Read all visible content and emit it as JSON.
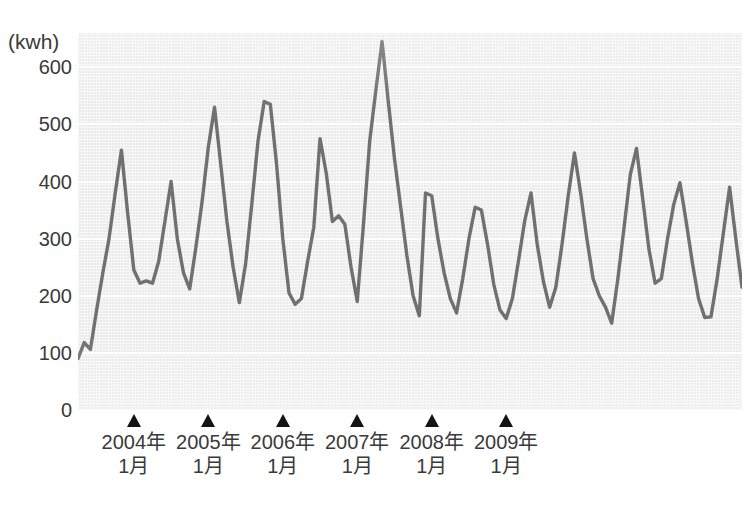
{
  "chart_data": {
    "type": "line",
    "title": "",
    "subtitle": "",
    "xlabel": "",
    "ylabel": "",
    "unit_label": "(kwh)",
    "grid": true,
    "legend": false,
    "ylim": [
      0,
      660
    ],
    "yticks": [
      0,
      100,
      200,
      300,
      400,
      500,
      600
    ],
    "ytick_labels": [
      "0",
      "100",
      "200",
      "300",
      "400",
      "500",
      "600"
    ],
    "x_markers": [
      {
        "label_year": "2004年",
        "label_month": "1月",
        "index": 9
      },
      {
        "label_year": "2005年",
        "label_month": "1月",
        "index": 21
      },
      {
        "label_year": "2006年",
        "label_month": "1月",
        "index": 33
      },
      {
        "label_year": "2007年",
        "label_month": "1月",
        "index": 45
      },
      {
        "label_year": "2008年",
        "label_month": "1月",
        "index": 57
      },
      {
        "label_year": "2009年",
        "label_month": "1月",
        "index": 69
      }
    ],
    "series": [
      {
        "name": "電力使用量",
        "color": "#707070",
        "values": [
          90,
          118,
          106,
          175,
          240,
          300,
          380,
          455,
          345,
          245,
          222,
          226,
          222,
          260,
          330,
          400,
          300,
          240,
          212,
          285,
          365,
          460,
          530,
          430,
          330,
          250,
          188,
          255,
          360,
          470,
          540,
          535,
          430,
          300,
          205,
          185,
          195,
          260,
          320,
          475,
          415,
          330,
          340,
          325,
          250,
          190,
          325,
          470,
          560,
          645,
          540,
          440,
          355,
          270,
          200,
          165,
          380,
          375,
          300,
          240,
          195,
          170,
          230,
          300,
          355,
          350,
          290,
          220,
          175,
          160,
          195,
          262,
          332,
          380,
          290,
          225,
          180,
          215,
          290,
          375,
          450,
          380,
          300,
          230,
          200,
          180,
          152,
          230,
          320,
          412,
          458,
          370,
          282,
          222,
          230,
          300,
          360,
          398,
          330,
          258,
          195,
          162,
          163,
          230,
          310,
          390,
          300,
          215
        ]
      }
    ]
  }
}
